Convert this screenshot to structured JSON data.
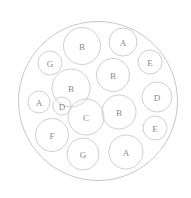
{
  "diagram": {
    "type": "circle-packing",
    "background_color": "#ffffff",
    "outer_circle": {
      "label": "",
      "cx": 98,
      "cy": 101,
      "r": 79.5,
      "stroke_color": "#b9b9b9",
      "fill_color": "#ffffff"
    },
    "style": {
      "circle_stroke_color": "#c3c3c3",
      "label_text_color": "#8a8a8a",
      "label_font_size": 9
    },
    "circles": [
      {
        "label": "B",
        "cx": 82,
        "cy": 46,
        "r": 18.5
      },
      {
        "label": "A",
        "cx": 123,
        "cy": 42,
        "r": 14.0
      },
      {
        "label": "G",
        "cx": 50,
        "cy": 63,
        "r": 12.0
      },
      {
        "label": "B",
        "cx": 113,
        "cy": 75,
        "r": 16.5
      },
      {
        "label": "E",
        "cx": 150,
        "cy": 62,
        "r": 12.0
      },
      {
        "label": "B",
        "cx": 71,
        "cy": 88,
        "r": 19.0
      },
      {
        "label": "D",
        "cx": 157,
        "cy": 97,
        "r": 15.0
      },
      {
        "label": "A",
        "cx": 39,
        "cy": 102,
        "r": 11.0
      },
      {
        "label": "D",
        "cx": 62,
        "cy": 106,
        "r": 9.0
      },
      {
        "label": "C",
        "cx": 86,
        "cy": 117,
        "r": 18.0
      },
      {
        "label": "B",
        "cx": 119,
        "cy": 112,
        "r": 17.0
      },
      {
        "label": "E",
        "cx": 155,
        "cy": 128,
        "r": 12.0
      },
      {
        "label": "F",
        "cx": 52,
        "cy": 135,
        "r": 16.5
      },
      {
        "label": "G",
        "cx": 83,
        "cy": 154,
        "r": 16.0
      },
      {
        "label": "A",
        "cx": 126,
        "cy": 152,
        "r": 17.0
      }
    ]
  },
  "chart_data": {
    "type": "circle-packing",
    "title": "",
    "xlabel": "",
    "ylabel": "",
    "categories": [
      "A",
      "B",
      "C",
      "D",
      "E",
      "F",
      "G"
    ],
    "counts": [
      3,
      4,
      1,
      2,
      2,
      1,
      2
    ],
    "total_circles": 15,
    "labels": [
      "B",
      "A",
      "G",
      "B",
      "E",
      "B",
      "D",
      "A",
      "D",
      "C",
      "B",
      "E",
      "F",
      "G",
      "A"
    ],
    "radii": [
      18.5,
      14.0,
      12.0,
      16.5,
      12.0,
      19.0,
      15.0,
      11.0,
      9.0,
      18.0,
      17.0,
      12.0,
      16.5,
      16.0,
      17.0
    ],
    "x": [
      82,
      123,
      50,
      113,
      150,
      71,
      157,
      39,
      62,
      86,
      119,
      155,
      52,
      83,
      126
    ],
    "y": [
      46,
      42,
      63,
      75,
      62,
      88,
      97,
      102,
      106,
      117,
      112,
      128,
      135,
      154,
      152
    ],
    "container": {
      "cx": 98,
      "cy": 101,
      "r": 79.5
    },
    "grid": false,
    "legend": "none"
  }
}
